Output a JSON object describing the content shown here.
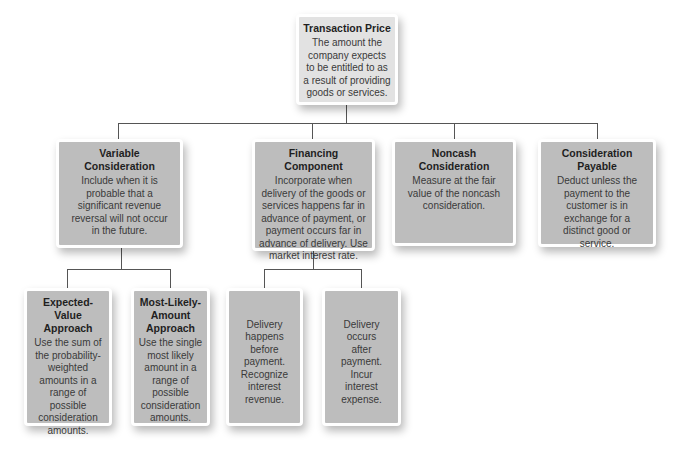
{
  "root": {
    "title": "Transaction Price",
    "body": "The amount the company expects to be entitled to as a result of providing goods or services."
  },
  "level1": [
    {
      "title": "Variable Consideration",
      "body": "Include when it is probable that a significant revenue reversal will not occur in the future."
    },
    {
      "title": "Financing Component",
      "body": "Incorporate when delivery of the goods or services happens far in advance of payment, or payment occurs far in advance of delivery. Use market interest rate."
    },
    {
      "title": "Noncash Consideration",
      "body": "Measure at the fair value of the noncash consideration."
    },
    {
      "title": "Consideration Payable",
      "body": "Deduct unless the payment to the customer is in exchange for a distinct good or service."
    }
  ],
  "level2_variable": [
    {
      "title": "Expected-Value Approach",
      "body": "Use the sum of the probability-weighted amounts in a range of possible consideration amounts."
    },
    {
      "title": "Most-Likely-Amount Approach",
      "body": "Use the single most likely amount in a range of possible consideration amounts."
    }
  ],
  "level2_financing": [
    {
      "body": "Delivery happens before payment. Recognize interest revenue."
    },
    {
      "body": "Delivery occurs after payment. Incur interest expense."
    }
  ],
  "colors": {
    "root_fill": "#e2e2e2",
    "node_fill": "#bdbdbd",
    "connector": "#555555",
    "border": "#ffffff"
  }
}
